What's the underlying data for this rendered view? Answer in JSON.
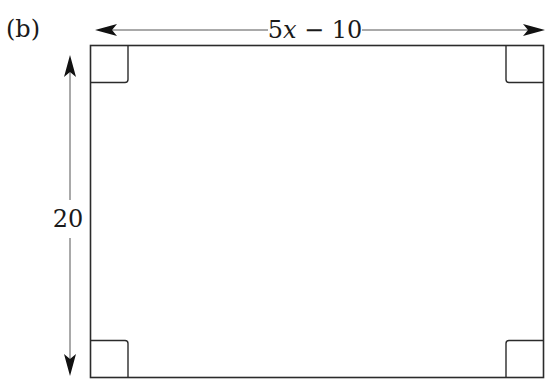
{
  "figure": {
    "label": "(b)",
    "shape": "rectangle",
    "dimensions": {
      "width_label_coef": "5",
      "width_label_var": "x",
      "width_label_rest": " − 10",
      "height_label": "20"
    },
    "right_angle_markers": 4,
    "colors": {
      "stroke": "#2b2b2b",
      "arrow": "#111111",
      "background": "#ffffff"
    }
  }
}
